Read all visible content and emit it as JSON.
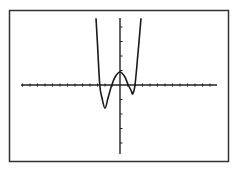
{
  "chart_data": {
    "type": "line",
    "title": "",
    "xlabel": "",
    "ylabel": "",
    "grid": false,
    "legend": null,
    "axis_ranges": {
      "xlim": [
        -13,
        13
      ],
      "ylim": [
        -4.7,
        4.7
      ]
    },
    "x_tick_spacing": 1,
    "y_tick_spacing": 1,
    "series": [
      {
        "name": "f(x)",
        "description": "W-shaped quartic-like curve",
        "x": [
          -3.2,
          -3.0,
          -2.7,
          -2.4,
          -2.0,
          -1.6,
          -1.1,
          -0.6,
          0.0,
          0.6,
          1.1,
          1.5,
          1.7,
          2.0,
          2.4,
          2.8
        ],
        "y": [
          4.6,
          2.8,
          0.0,
          -0.9,
          -1.6,
          -0.9,
          0.0,
          0.6,
          0.9,
          0.6,
          0.0,
          -0.4,
          -0.6,
          0.0,
          2.2,
          4.6
        ]
      }
    ],
    "features": {
      "x_intercepts": [
        -2.7,
        -1.1,
        1.1,
        2.0
      ],
      "local_minima": [
        [
          -2.0,
          -1.6
        ],
        [
          1.7,
          -0.6
        ]
      ],
      "local_maximum": [
        0.0,
        0.9
      ]
    }
  },
  "colors": {
    "background": "#ffffff",
    "frame": "#333333",
    "axes": "#222222",
    "curve": "#1a1a1a"
  }
}
